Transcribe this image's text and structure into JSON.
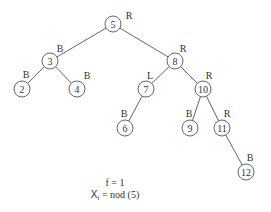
{
  "diagram": {
    "type": "binary-tree",
    "node_radius": 8,
    "nodes": [
      {
        "id": "5",
        "label": "5",
        "tag": "R",
        "x": 113,
        "y": 24,
        "tag_x": 129,
        "tag_y": 15
      },
      {
        "id": "3",
        "label": "3",
        "tag": "B",
        "x": 50,
        "y": 61,
        "tag_x": 60,
        "tag_y": 48
      },
      {
        "id": "8",
        "label": "8",
        "tag": "R",
        "x": 175,
        "y": 61,
        "tag_x": 183,
        "tag_y": 48
      },
      {
        "id": "2",
        "label": "2",
        "tag": "B",
        "x": 22,
        "y": 89,
        "tag_x": 26,
        "tag_y": 74
      },
      {
        "id": "4",
        "label": "4",
        "tag": "B",
        "x": 77,
        "y": 89,
        "tag_x": 87,
        "tag_y": 75
      },
      {
        "id": "7",
        "label": "7",
        "tag": "L",
        "x": 146,
        "y": 89,
        "tag_x": 150,
        "tag_y": 75
      },
      {
        "id": "10",
        "label": "10",
        "tag": "R",
        "x": 203,
        "y": 89,
        "tag_x": 209,
        "tag_y": 75
      },
      {
        "id": "6",
        "label": "6",
        "tag": "B",
        "x": 125,
        "y": 128,
        "tag_x": 124,
        "tag_y": 113
      },
      {
        "id": "9",
        "label": "9",
        "tag": "B",
        "x": 190,
        "y": 128,
        "tag_x": 189,
        "tag_y": 113
      },
      {
        "id": "11",
        "label": "11",
        "tag": "R",
        "x": 222,
        "y": 128,
        "tag_x": 227,
        "tag_y": 113
      },
      {
        "id": "12",
        "label": "12",
        "tag": "B",
        "x": 246,
        "y": 172,
        "tag_x": 250,
        "tag_y": 157
      }
    ],
    "edges": [
      {
        "from": "5",
        "to": "3"
      },
      {
        "from": "5",
        "to": "8"
      },
      {
        "from": "3",
        "to": "2"
      },
      {
        "from": "3",
        "to": "4"
      },
      {
        "from": "8",
        "to": "7"
      },
      {
        "from": "8",
        "to": "10"
      },
      {
        "from": "7",
        "to": "6"
      },
      {
        "from": "10",
        "to": "9"
      },
      {
        "from": "10",
        "to": "11"
      },
      {
        "from": "11",
        "to": "12"
      }
    ]
  },
  "caption": {
    "line1": "f = 1",
    "line2_var": "X",
    "line2_sub": "f",
    "line2_rest": " = nod (5)"
  }
}
